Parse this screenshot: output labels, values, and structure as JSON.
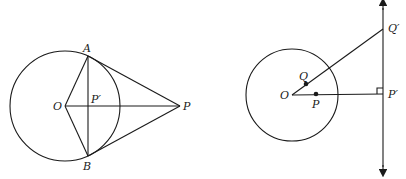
{
  "figures": [
    {
      "id": "left",
      "description": "Circle with center O, external point P, tangent lines PA and PB, chord AB meeting OP at P'",
      "labels": {
        "A": "A",
        "B": "B",
        "O": "O",
        "P": "P",
        "Pprime": "P′"
      }
    },
    {
      "id": "right",
      "description": "Circle with center O, interior points Q and P, rays OQ and OP extended to vertical line at Q' and P' (right angle at P')",
      "labels": {
        "O": "O",
        "Q": "Q",
        "P": "P",
        "Qprime": "Q′",
        "Pprime": "P′"
      }
    }
  ]
}
